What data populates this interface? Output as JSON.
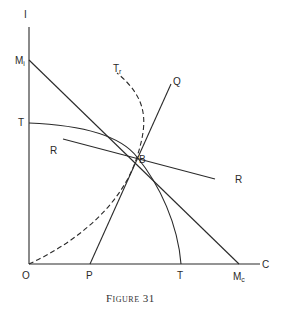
{
  "diagram": {
    "axes": {
      "y_label": "I",
      "x_label": "C",
      "origin_label": "O"
    },
    "labels": {
      "M_i": {
        "main": "M",
        "sub": "i"
      },
      "T_top": "T",
      "R_left": "R",
      "R_right": "R",
      "Tr": {
        "main": "T",
        "sub": "r"
      },
      "Q": "Q",
      "B": "B",
      "P": "P",
      "T_bottom": "T",
      "M_c": {
        "main": "M",
        "sub": "c"
      }
    },
    "caption": "Figure 31"
  }
}
